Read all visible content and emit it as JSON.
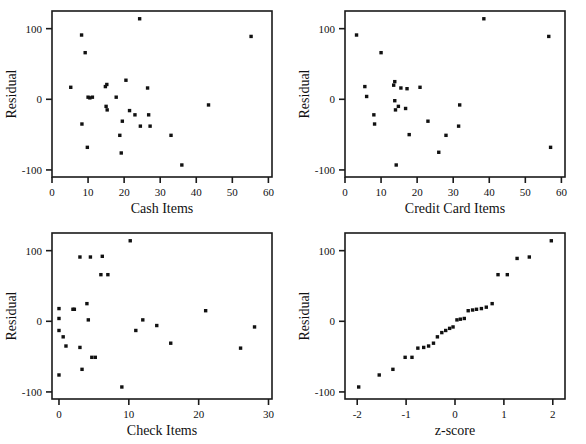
{
  "figure": {
    "background": "#ffffff",
    "point_color": "#111111",
    "axis_color": "#1a1a1a",
    "panel_count": 4
  },
  "chart_data": [
    {
      "type": "scatter",
      "title": "",
      "xlabel": "Cash Items",
      "ylabel": "Residual",
      "xlim": [
        0,
        61
      ],
      "ylim": [
        -110,
        125
      ],
      "xticks": [
        0,
        10,
        20,
        30,
        40,
        50,
        60
      ],
      "xticklabels": [
        "0",
        "10",
        "20",
        "30",
        "40",
        "50",
        "60"
      ],
      "yticks": [
        -100,
        0,
        100
      ],
      "yticklabels": [
        "-100",
        "0",
        "100"
      ],
      "grid": false,
      "legend": "none",
      "x": [
        5.2,
        8.2,
        8.3,
        9.2,
        9.8,
        10.5,
        10.0,
        11.2,
        14.8,
        15.2,
        15.0,
        15.3,
        17.8,
        18.8,
        19.2,
        19.5,
        20.5,
        21.5,
        23.0,
        24.3,
        24.5,
        26.5,
        26.8,
        27.2,
        33.0,
        36.0,
        43.4,
        55.2
      ],
      "y": [
        17,
        91,
        -35,
        66,
        -68,
        2,
        3,
        3,
        18,
        21,
        -10,
        -15,
        3,
        -51,
        -76,
        -31,
        27,
        -16,
        -22,
        114,
        -38,
        16,
        -22,
        -38,
        -51,
        -93,
        -8,
        89
      ]
    },
    {
      "type": "scatter",
      "title": "",
      "xlabel": "Credit Card Items",
      "ylabel": "Residual",
      "xlim": [
        0,
        61
      ],
      "ylim": [
        -110,
        125
      ],
      "xticks": [
        0,
        10,
        20,
        30,
        40,
        50,
        60
      ],
      "xticklabels": [
        "0",
        "10",
        "20",
        "30",
        "40",
        "50",
        "60"
      ],
      "yticks": [
        -100,
        0,
        100
      ],
      "yticklabels": [
        "-100",
        "0",
        "100"
      ],
      "grid": false,
      "legend": "none",
      "x": [
        3.2,
        5.5,
        6.0,
        8.0,
        8.2,
        10.0,
        13.5,
        13.8,
        13.8,
        14.0,
        14.2,
        14.8,
        15.5,
        16.8,
        17.2,
        17.8,
        20.8,
        23.0,
        26.0,
        28.0,
        31.5,
        31.8,
        38.5,
        56.5,
        57.0
      ],
      "y": [
        91,
        18,
        4,
        -22,
        -35,
        66,
        20,
        25,
        -2,
        -15,
        -93,
        -10,
        16,
        -13,
        15,
        -50,
        17,
        -31,
        -75,
        -51,
        -38,
        -8,
        114,
        89,
        -68
      ]
    },
    {
      "type": "scatter",
      "title": "",
      "xlabel": "Check Items",
      "ylabel": "Residual",
      "xlim": [
        -1,
        30.5
      ],
      "ylim": [
        -110,
        125
      ],
      "xticks": [
        0,
        10,
        20,
        30
      ],
      "xticklabels": [
        "0",
        "10",
        "20",
        "30"
      ],
      "yticks": [
        -100,
        0,
        100
      ],
      "yticklabels": [
        "-100",
        "0",
        "100"
      ],
      "grid": false,
      "legend": "none",
      "x": [
        0.0,
        0.0,
        0.0,
        0.0,
        0.6,
        1.0,
        2.0,
        2.2,
        3.0,
        3.0,
        3.3,
        4.0,
        4.2,
        4.5,
        4.7,
        5.2,
        6.0,
        6.2,
        7.0,
        9.0,
        10.2,
        11.0,
        12.0,
        14.0,
        16.0,
        21.0,
        26.0,
        28.0
      ],
      "y": [
        18,
        4,
        -13,
        -76,
        -22,
        -35,
        17,
        17,
        -37,
        91,
        -68,
        25,
        2,
        91,
        -51,
        -51,
        66,
        92,
        66,
        -93,
        114,
        -13,
        2,
        -6,
        -31,
        15,
        -38,
        -8
      ]
    },
    {
      "type": "scatter",
      "title": "",
      "xlabel": "z-score",
      "ylabel": "Residual",
      "xlim": [
        -2.25,
        2.25
      ],
      "yticks": [
        -100,
        0,
        100
      ],
      "ylim": [
        -110,
        125
      ],
      "xticks": [
        -2,
        -1,
        0,
        1,
        2
      ],
      "xticklabels": [
        "-2",
        "-1",
        "0",
        "1",
        "2"
      ],
      "yticklabels": [
        "-100",
        "0",
        "100"
      ],
      "grid": false,
      "legend": "none",
      "x": [
        -1.97,
        -1.55,
        -1.27,
        -1.02,
        -0.88,
        -0.76,
        -0.64,
        -0.54,
        -0.44,
        -0.36,
        -0.27,
        -0.19,
        -0.11,
        -0.04,
        0.04,
        0.11,
        0.19,
        0.27,
        0.36,
        0.44,
        0.54,
        0.64,
        0.76,
        0.88,
        1.07,
        1.27,
        1.52,
        1.97
      ],
      "y": [
        -93,
        -76,
        -68,
        -51,
        -51,
        -38,
        -37,
        -35,
        -31,
        -22,
        -16,
        -13,
        -10,
        -8,
        2,
        3,
        4,
        15,
        16,
        17,
        18,
        20,
        25,
        66,
        66,
        89,
        91,
        114
      ]
    }
  ],
  "panels": [
    {
      "name": "cash-items",
      "xlabel": "Cash Items",
      "ylabel": "Residual"
    },
    {
      "name": "credit-card-items",
      "xlabel": "Credit Card Items",
      "ylabel": "Residual"
    },
    {
      "name": "check-items",
      "xlabel": "Check Items",
      "ylabel": "Residual"
    },
    {
      "name": "z-score",
      "xlabel": "z-score",
      "ylabel": "Residual"
    }
  ]
}
